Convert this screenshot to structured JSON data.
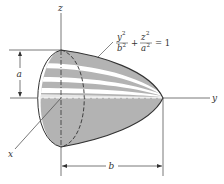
{
  "diagram": {
    "type": "paraboloid-of-revolution",
    "axes": {
      "z_label": "z",
      "y_label": "y",
      "x_label": "x"
    },
    "dimensions": {
      "height_label": "a",
      "length_label": "b"
    },
    "equation": {
      "term1_num": "y",
      "term1_num_exp": "2",
      "term1_den": "b",
      "term1_den_exp": "2",
      "plus": "+",
      "term2_num": "z",
      "term2_num_exp": "2",
      "term2_den": "a",
      "term2_den_exp": "2",
      "equals": "= 1"
    },
    "colors": {
      "fill": "#b3b3b3",
      "highlight": "#ffffff",
      "stroke": "#333333",
      "line": "#555555"
    }
  }
}
